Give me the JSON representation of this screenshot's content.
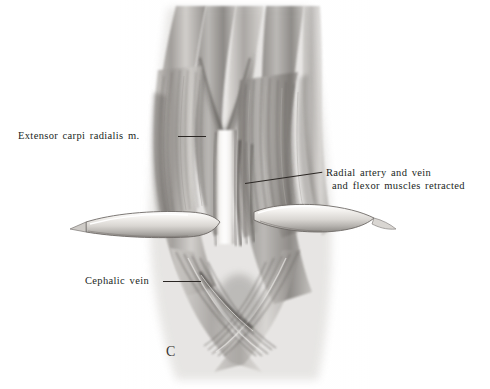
{
  "figure": {
    "letter": "C",
    "background_color": "#ffffff",
    "ink_color": "#221f1c",
    "medium": "graphite-pencil-grayscale"
  },
  "labels": [
    {
      "id": "extensor-carpi-radialis",
      "text": "Extensor carpi radialis m.",
      "position": "left",
      "leader": "horizontal"
    },
    {
      "id": "radial-artery-vein",
      "line1": "Radial artery and vein",
      "line2": "and flexor muscles retracted",
      "position": "right",
      "leader": "diagonal"
    },
    {
      "id": "cephalic-vein",
      "text": "Cephalic vein",
      "position": "lower-left",
      "leader": "horizontal"
    }
  ],
  "illustration": {
    "subject": "forearm-surgical-exposure",
    "structures": [
      "extensor carpi radialis muscle",
      "radial artery and vein",
      "flexor muscles retracted",
      "cephalic vein",
      "retractor band left",
      "retractor band right",
      "open incision"
    ]
  }
}
